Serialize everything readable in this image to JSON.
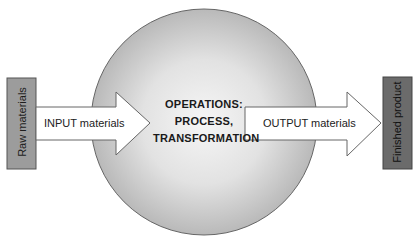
{
  "diagram": {
    "type": "process-flow",
    "input_box": {
      "label": "Raw materials",
      "fill": "#9c9c9c"
    },
    "input_arrow": {
      "label": "INPUT materials"
    },
    "center": {
      "lines": [
        "OPERATIONS:",
        "PROCESS,",
        "TRANSFORMATION"
      ],
      "shape": "circle",
      "fill_gradient": [
        "#f4f4f4",
        "#bdbdbd"
      ]
    },
    "output_arrow": {
      "label": "OUTPUT materials"
    },
    "output_box": {
      "label": "Finished product",
      "fill": "#6b6b6b"
    },
    "colors": {
      "stroke": "#555555",
      "arrow_fill": "#ffffff",
      "text": "#222222"
    }
  }
}
